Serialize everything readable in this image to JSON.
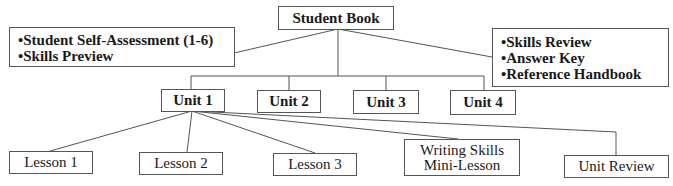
{
  "root": {
    "label": "Student Book"
  },
  "front_matter": {
    "items": [
      "Student Self-Assessment (1-6)",
      "Skills Preview"
    ]
  },
  "back_matter": {
    "items": [
      "Skills Review",
      "Answer Key",
      "Reference Handbook"
    ]
  },
  "units": [
    {
      "label": "Unit 1"
    },
    {
      "label": "Unit 2"
    },
    {
      "label": "Unit 3"
    },
    {
      "label": "Unit 4"
    }
  ],
  "unit1_children": [
    {
      "label": "Lesson 1"
    },
    {
      "label": "Lesson 2"
    },
    {
      "label": "Lesson 3"
    },
    {
      "line1": "Writing Skills",
      "line2": "Mini-Lesson"
    },
    {
      "label": "Unit Review"
    }
  ]
}
